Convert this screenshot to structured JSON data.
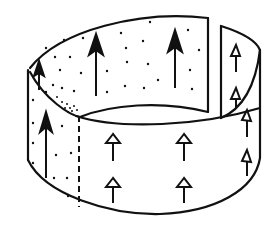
{
  "diagram": {
    "type": "cylindrical-band-illustration",
    "colors": {
      "line": "#111111",
      "background": "#ffffff"
    },
    "elements": {
      "band": "cylindrical strip with a vertical slit on right side",
      "inner_arrows": "solid filled arrows on inner back surface",
      "outer_arrows": "hollow open arrows on outer front surface",
      "dashed_line": "vertical dashed boundary on front-left",
      "dots": "stippled dots on inner surface"
    }
  }
}
